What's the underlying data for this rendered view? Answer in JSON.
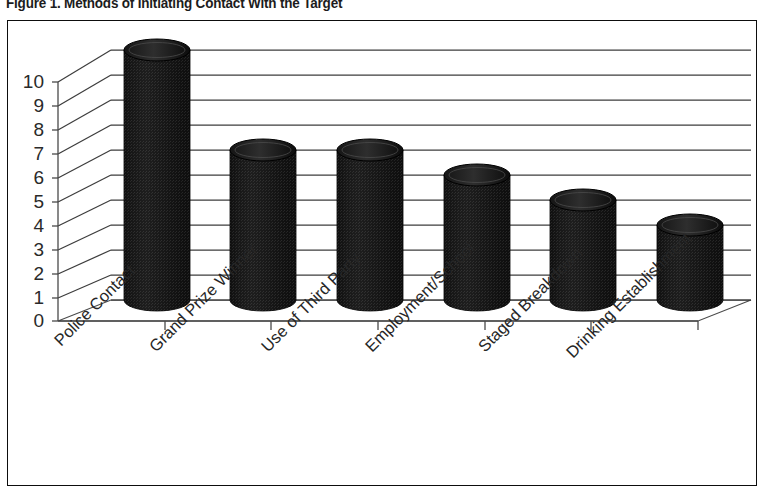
{
  "figure": {
    "title": "Figure 1. Methods of Initiating Contact With the Target"
  },
  "chart_data": {
    "type": "bar",
    "title": "Figure 1. Methods of Initiating Contact With the Target",
    "subtitle": "",
    "xlabel": "",
    "ylabel": "",
    "categories": [
      "Police Contact",
      "Grand Prize Winner",
      "Use of Third Party",
      "Employment/School",
      "Staged Breakdown",
      "Drinking Establishment"
    ],
    "values": [
      10,
      6,
      6,
      5,
      4,
      3
    ],
    "ylim": [
      0,
      10
    ],
    "ytick_labels": [
      "0",
      "1",
      "2",
      "3",
      "4",
      "5",
      "6",
      "7",
      "8",
      "9",
      "10"
    ],
    "ytick_values": [
      0,
      1,
      2,
      3,
      4,
      5,
      6,
      7,
      8,
      9,
      10
    ],
    "grid": true,
    "grid_axis": "y",
    "legend": false,
    "legend_position": "none",
    "style": "3d-cylinder",
    "bar_color": "#1a1a1a",
    "grid_color": "#3a3a3a",
    "axis_color": "#4a4a4a",
    "background_color": "#ffffff",
    "xtick_label_rotation": -45
  }
}
